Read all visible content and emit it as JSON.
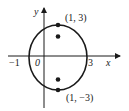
{
  "diagram": {
    "type": "ellipse-graph",
    "axes": {
      "x_label": "x",
      "y_label": "y",
      "x_ticks": [
        {
          "value": -1,
          "label": "−1"
        },
        {
          "value": 0,
          "label": "0"
        },
        {
          "value": 3,
          "label": "3"
        }
      ]
    },
    "ellipse": {
      "center": [
        1,
        0
      ],
      "semi_major_vertical": 3,
      "semi_minor_horizontal": 2
    },
    "points": [
      {
        "name": "vertex-top",
        "coords": [
          1,
          3
        ],
        "label": "(1, 3)"
      },
      {
        "name": "focus-top",
        "label": ""
      },
      {
        "name": "focus-bottom",
        "label": ""
      },
      {
        "name": "vertex-bottom",
        "coords": [
          1,
          -3
        ],
        "label": "(1, −3)"
      }
    ],
    "colors": {
      "stroke": "#1a1a1a",
      "background": "#ffffff"
    }
  }
}
